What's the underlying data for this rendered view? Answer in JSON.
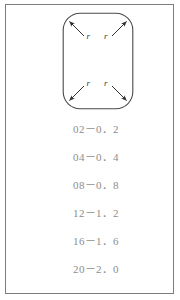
{
  "page": {
    "background_color": "#ffffff",
    "frame_border_color": "#7d7d7d"
  },
  "diagram": {
    "name": "rounded-rectangle-corner-radius-diagram",
    "shape": "rounded-rectangle",
    "stroke_color": "#4a4a4a",
    "corner_labels": [
      {
        "position": "top-left",
        "label": "r"
      },
      {
        "position": "top-right",
        "label": "r"
      },
      {
        "position": "bottom-left",
        "label": "r"
      },
      {
        "position": "bottom-right",
        "label": "r"
      }
    ],
    "arrows": 4,
    "arrow_description": "four arrows pointing outward to each rounded corner"
  },
  "value_list": {
    "name": "radius-value-list",
    "text_color": "#8d8d8d",
    "rows": [
      {
        "code": "02",
        "separator": "－",
        "value": "0．2",
        "text": "02－0．2"
      },
      {
        "code": "04",
        "separator": "－",
        "value": "0．4",
        "text": "04－0．4"
      },
      {
        "code": "08",
        "separator": "－",
        "value": "0．8",
        "text": "08－0．8"
      },
      {
        "code": "12",
        "separator": "－",
        "value": "1．2",
        "text": "12－1．2"
      },
      {
        "code": "16",
        "separator": "－",
        "value": "1．6",
        "text": "16－1．6"
      },
      {
        "code": "20",
        "separator": "－",
        "value": "2．0",
        "text": "20－2．0"
      }
    ]
  }
}
